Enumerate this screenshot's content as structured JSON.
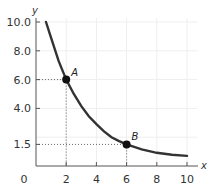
{
  "chart_data": {
    "type": "line",
    "title": "",
    "xlabel": "x",
    "ylabel": "y",
    "xlim": [
      0,
      10
    ],
    "ylim": [
      0,
      10
    ],
    "grid": true,
    "x_ticks": [
      0,
      2,
      4,
      6,
      8,
      10
    ],
    "x_tick_labels": [
      "0",
      "2",
      "4",
      "6",
      "8",
      "10"
    ],
    "y_ticks": [
      1.5,
      4.0,
      6.0,
      8.0,
      10.0
    ],
    "y_tick_labels": [
      "1.5",
      "4.0",
      "6.0",
      "8.0",
      "10.0"
    ],
    "series": [
      {
        "name": "curve",
        "x": [
          0.66,
          1.0,
          1.5,
          2.0,
          2.5,
          3.0,
          3.5,
          4.0,
          4.5,
          5.0,
          5.5,
          6.0,
          7.0,
          8.0,
          9.0,
          10.0
        ],
        "y": [
          10.0,
          8.9,
          7.3,
          6.0,
          5.0,
          4.15,
          3.45,
          2.9,
          2.4,
          2.0,
          1.73,
          1.5,
          1.15,
          0.92,
          0.78,
          0.7
        ]
      }
    ],
    "points": [
      {
        "label": "A",
        "x": 2,
        "y": 6.0
      },
      {
        "label": "B",
        "x": 6,
        "y": 1.5
      }
    ]
  },
  "colors": {
    "curve": "#333333",
    "grid": "#eeeeee",
    "axis": "#555555",
    "guide": "#666666"
  }
}
